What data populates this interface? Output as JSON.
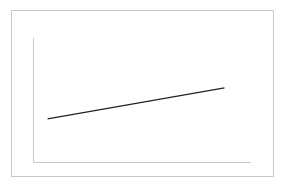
{
  "chart_data": {
    "type": "line",
    "title": "",
    "xlabel": "",
    "ylabel": "",
    "grid": false,
    "legend": null,
    "x": [
      0,
      1
    ],
    "series": [
      {
        "name": "series-1",
        "values": [
          0.35,
          0.6
        ],
        "color": "#222222"
      }
    ],
    "xlim": [
      -0.08,
      1.15
    ],
    "ylim": [
      0,
      1
    ],
    "axis_color": "#c8c8c8",
    "frame_color": "#c8c8c8"
  }
}
